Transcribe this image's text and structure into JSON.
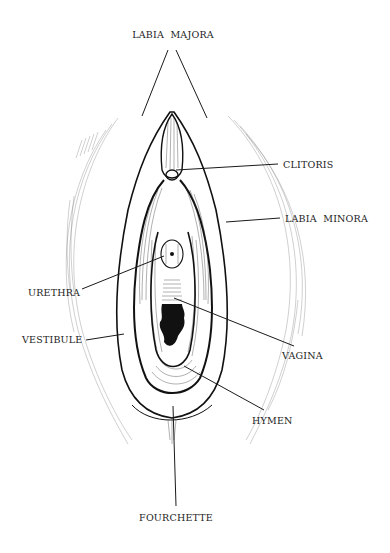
{
  "figure": {
    "type": "anatomical line illustration",
    "labels": {
      "labia_majora": "LABIA  MAJORA",
      "clitoris": "CLITORIS",
      "labia_minora": "LABIA  MINORA",
      "urethra": "URETHRA",
      "vestibule": "VESTIBULE",
      "vagina": "VAGINA",
      "hymen": "HYMEN",
      "fourchette": "FOURCHETTE"
    }
  }
}
